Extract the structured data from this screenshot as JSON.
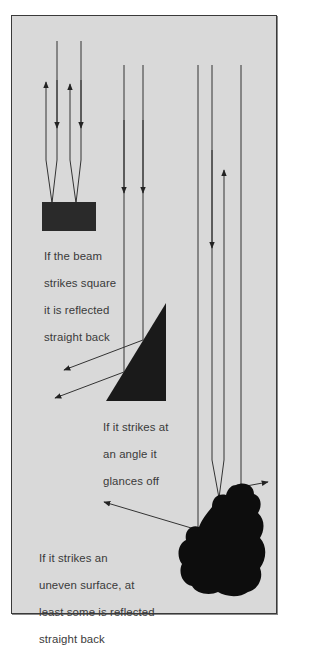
{
  "diagram": {
    "colors": {
      "background": "#d9d9d9",
      "frame": "#3a3a3a",
      "ink": "#111111",
      "text": "#3a3a3a"
    },
    "panels": [
      {
        "id": "square",
        "shape": "rectangle",
        "caption_lines": [
          "If the beam",
          "strikes square",
          "it is reflected",
          "straight back"
        ]
      },
      {
        "id": "angle",
        "shape": "right-triangle",
        "caption_lines": [
          "If it strikes at",
          "an angle it",
          "glances off"
        ]
      },
      {
        "id": "uneven",
        "shape": "irregular-blob",
        "caption_lines": [
          "If it strikes an",
          "uneven surface, at",
          "least some is reflected",
          "straight back"
        ]
      }
    ]
  }
}
